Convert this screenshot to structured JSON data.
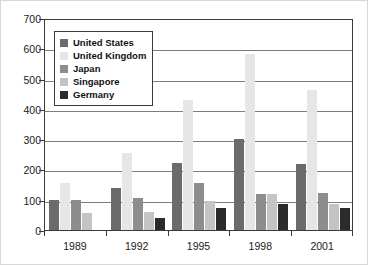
{
  "chart_data": {
    "type": "bar",
    "title": "",
    "subtitle": "",
    "xlabel": "",
    "ylabel": "",
    "categories": [
      "1989",
      "1992",
      "1995",
      "1998",
      "2001"
    ],
    "ylim": [
      0,
      700
    ],
    "yticks": [
      0,
      100,
      200,
      300,
      400,
      500,
      600,
      700
    ],
    "ytick_labels": [
      "0",
      "100",
      "200",
      "300",
      "400",
      "500",
      "600",
      "700"
    ],
    "grid": true,
    "legend_position": "upper-left-inside",
    "series": [
      {
        "name": "United States",
        "color": "#6b6b6b",
        "values": [
          100,
          140,
          220,
          300,
          218
        ]
      },
      {
        "name": "United Kingdom",
        "color": "#e6e6e6",
        "values": [
          155,
          255,
          430,
          580,
          462
        ]
      },
      {
        "name": "Japan",
        "color": "#8d8d8d",
        "values": [
          100,
          105,
          155,
          118,
          122
        ]
      },
      {
        "name": "Singapore",
        "color": "#c4c4c4",
        "values": [
          55,
          58,
          95,
          118,
          85
        ]
      },
      {
        "name": "Germany",
        "color": "#2b2b2b",
        "values": [
          0,
          40,
          72,
          87,
          73
        ]
      }
    ]
  },
  "colors": {
    "axis": "#3a3a3a",
    "gridline": "#7e7e7e",
    "text": "#1a1a1a",
    "background": "#ffffff",
    "frame": "#d8d8d8"
  }
}
